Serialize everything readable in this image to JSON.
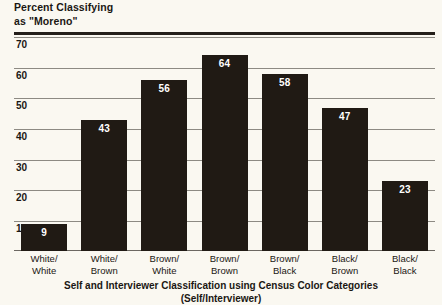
{
  "chart_data": {
    "type": "bar",
    "title": "Percent Classifying as \"Moreno\"",
    "title_line1": "Percent Classifying",
    "title_line2": "as \"Moreno\"",
    "xlabel": "Self and Interviewer Classification using Census Color Categories (Self/Interviewer)",
    "xlabel_line1": "Self and Interviewer Classification using Census Color Categories",
    "xlabel_line2": "(Self/Interviewer)",
    "ylabel": "Percent Classifying as \"Moreno\"",
    "categories": [
      "White/White",
      "White/Brown",
      "Brown/White",
      "Brown/Brown",
      "Brown/Black",
      "Black/Brown",
      "Black/Black"
    ],
    "category_lines": [
      [
        "White/",
        "White"
      ],
      [
        "White/",
        "Brown"
      ],
      [
        "Brown/",
        "White"
      ],
      [
        "Brown/",
        "Brown"
      ],
      [
        "Brown/",
        "Black"
      ],
      [
        "Black/",
        "Brown"
      ],
      [
        "Black/",
        "Black"
      ]
    ],
    "values": [
      9,
      43,
      56,
      64,
      58,
      47,
      23
    ],
    "value_labels": [
      "9",
      "43",
      "56",
      "64",
      "58",
      "47",
      "23"
    ],
    "yticks": [
      70,
      60,
      50,
      40,
      30,
      20,
      10
    ],
    "ytick_labels": [
      "70",
      "60",
      "50",
      "40",
      "30",
      "20",
      "10"
    ],
    "ylim": [
      0,
      70
    ],
    "grid": true,
    "legend": "none",
    "bar_color": "#201a14",
    "value_label_color": "#ffffff",
    "background_color": "#faf8f1",
    "gridline_color": "#8d8a83",
    "text_color": "#1a1713"
  }
}
